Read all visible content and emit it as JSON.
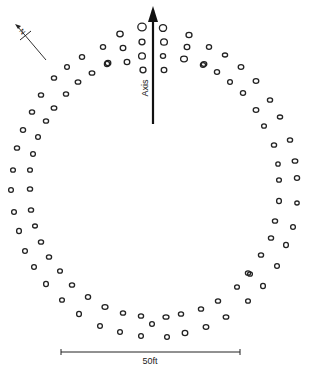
{
  "diagram": {
    "colors": {
      "ink": "#222222",
      "background": "#ffffff"
    },
    "axis": {
      "label": "Axis",
      "x": 153,
      "y_start": 124,
      "y_end": 8
    },
    "north_arrow": {
      "label": "N",
      "from": [
        46,
        60
      ],
      "to": [
        16,
        25
      ],
      "crossbar_center": [
        25,
        36
      ]
    },
    "scale_bar": {
      "label": "50ft",
      "x1": 61,
      "x2": 240,
      "y": 352
    },
    "posts": [
      [
        142,
        27,
        4.2,
        3.8
      ],
      [
        163,
        28,
        3.6,
        3.4
      ],
      [
        142,
        42,
        3,
        2.8
      ],
      [
        164,
        42,
        3.4,
        3.2
      ],
      [
        142,
        56,
        3.4,
        3.2
      ],
      [
        163,
        56,
        2.6,
        2.4
      ],
      [
        143,
        70,
        3,
        2.8
      ],
      [
        164,
        70,
        2.8,
        2.6
      ],
      [
        120,
        34,
        3.2,
        2.8
      ],
      [
        123,
        48,
        2.8,
        2.6
      ],
      [
        127,
        62,
        2.8,
        2.6
      ],
      [
        108,
        63,
        2.8,
        2.6
      ],
      [
        189,
        35,
        3,
        2.6
      ],
      [
        187,
        47,
        2.8,
        2.6
      ],
      [
        184,
        59,
        3.4,
        2.8
      ],
      [
        204,
        64,
        2.8,
        2.4
      ],
      [
        103,
        47,
        2.6,
        2.4
      ],
      [
        82,
        57,
        2.6,
        2.4
      ],
      [
        107,
        64,
        2.6,
        2.6
      ],
      [
        67,
        67,
        2.4,
        2.4
      ],
      [
        92,
        73,
        2.8,
        2.2
      ],
      [
        54,
        78,
        2.6,
        2.2
      ],
      [
        78,
        82,
        2.8,
        2.2
      ],
      [
        41,
        95,
        2.6,
        2.2
      ],
      [
        66,
        94,
        2.6,
        2.2
      ],
      [
        32,
        112,
        2.6,
        2.2
      ],
      [
        54,
        108,
        2.8,
        2.2
      ],
      [
        23,
        130,
        2.6,
        2.4
      ],
      [
        46,
        121,
        2.6,
        2.2
      ],
      [
        38,
        137,
        2.4,
        2.4
      ],
      [
        17,
        148,
        2.6,
        2.2
      ],
      [
        209,
        47,
        2.6,
        2.4
      ],
      [
        225,
        55,
        2.6,
        2
      ],
      [
        203,
        65,
        2.6,
        2.4
      ],
      [
        217,
        72,
        2.6,
        2.4
      ],
      [
        241,
        67,
        2.8,
        2.4
      ],
      [
        230,
        82,
        2.4,
        2.4
      ],
      [
        256,
        81,
        2.8,
        2.4
      ],
      [
        243,
        93,
        2.6,
        2.4
      ],
      [
        270,
        100,
        2.6,
        2.2
      ],
      [
        256,
        110,
        2.8,
        2.4
      ],
      [
        280,
        117,
        2.6,
        2
      ],
      [
        264,
        126,
        2.4,
        2.2
      ],
      [
        290,
        140,
        2.6,
        2.2
      ],
      [
        274,
        145,
        2.6,
        2.2
      ],
      [
        33,
        154,
        2.4,
        2.4
      ],
      [
        13,
        170,
        2.4,
        2.2
      ],
      [
        30,
        170,
        2.4,
        2.2
      ],
      [
        11,
        190,
        2.4,
        2.4
      ],
      [
        30,
        189,
        2.6,
        2.2
      ],
      [
        14,
        212,
        2.4,
        2.4
      ],
      [
        31,
        210,
        2.6,
        2.2
      ],
      [
        19,
        231,
        2.4,
        2.6
      ],
      [
        35,
        226,
        2.4,
        2
      ],
      [
        41,
        242,
        2.6,
        2.2
      ],
      [
        25,
        251,
        2.4,
        2.4
      ],
      [
        49,
        257,
        2.6,
        2.2
      ],
      [
        34,
        267,
        2.4,
        2.4
      ],
      [
        60,
        271,
        2.4,
        2.2
      ],
      [
        46,
        284,
        2.4,
        2.6
      ],
      [
        72,
        285,
        2.6,
        2.2
      ],
      [
        278,
        164,
        2.2,
        2.2
      ],
      [
        295,
        161,
        2.8,
        2.2
      ],
      [
        279,
        180,
        2.4,
        2.2
      ],
      [
        297,
        178,
        2.6,
        2.4
      ],
      [
        279,
        201,
        2.4,
        2.6
      ],
      [
        297,
        203,
        2.2,
        2
      ],
      [
        275,
        221,
        2.6,
        2.2
      ],
      [
        293,
        227,
        2.4,
        2.4
      ],
      [
        271,
        238,
        2.6,
        2.2
      ],
      [
        286,
        245,
        2.4,
        2.6
      ],
      [
        261,
        255,
        2.6,
        2.2
      ],
      [
        277,
        266,
        2.4,
        2.4
      ],
      [
        250,
        274,
        2.4,
        2.2
      ],
      [
        263,
        286,
        2.4,
        2.6
      ],
      [
        62,
        300,
        2.4,
        2.2
      ],
      [
        88,
        297,
        2.6,
        2.4
      ],
      [
        105,
        307,
        3,
        2.4
      ],
      [
        79,
        314,
        2.4,
        2.6
      ],
      [
        123,
        313,
        2.6,
        2.2
      ],
      [
        100,
        326,
        2.4,
        2.4
      ],
      [
        141,
        316,
        2.6,
        2.2
      ],
      [
        152,
        324,
        2.4,
        2.4
      ],
      [
        166,
        317,
        3,
        2.2
      ],
      [
        181,
        314,
        2.6,
        2.2
      ],
      [
        120,
        332,
        2.4,
        2.4
      ],
      [
        141,
        336,
        2.4,
        2.4
      ],
      [
        167,
        337,
        2.4,
        2.4
      ],
      [
        185,
        333,
        2.8,
        2.6
      ],
      [
        201,
        309,
        2.6,
        2.2
      ],
      [
        206,
        327,
        2.8,
        2.4
      ],
      [
        218,
        301,
        2.6,
        2.2
      ],
      [
        226,
        317,
        2.8,
        2.2
      ],
      [
        237,
        287,
        2.4,
        2.2
      ],
      [
        248,
        301,
        2.4,
        2.2
      ],
      [
        248,
        273,
        2.6,
        2.2
      ]
    ]
  }
}
